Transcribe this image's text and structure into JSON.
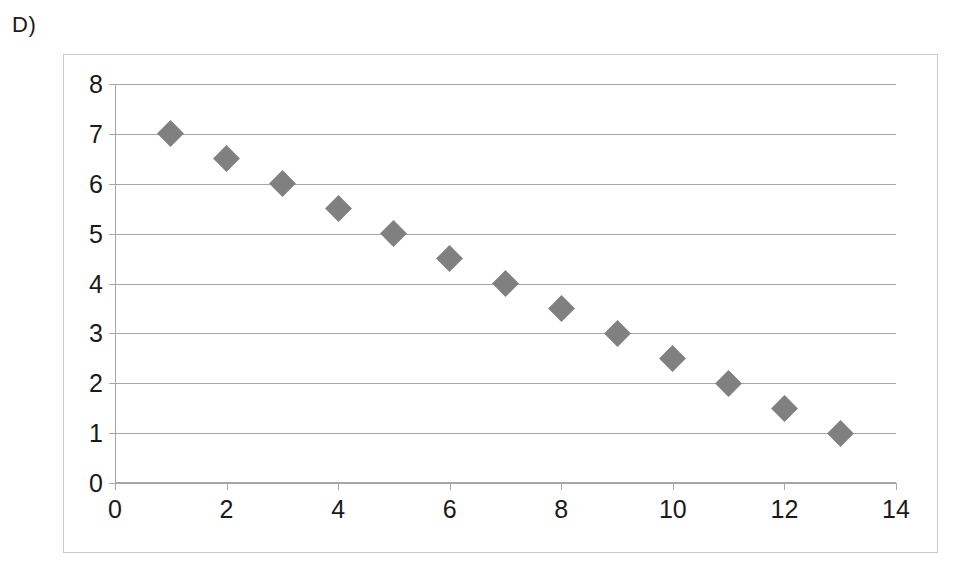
{
  "panel": {
    "label": "D)"
  },
  "colors": {
    "marker": "#808080",
    "gridline": "#a6a6a6",
    "frame_border": "#c8c8c8",
    "text": "#1a1a1a",
    "background": "#ffffff"
  },
  "chart_data": {
    "type": "scatter",
    "title": "",
    "xlabel": "",
    "ylabel": "",
    "xlim": [
      0,
      14
    ],
    "ylim": [
      0,
      8
    ],
    "x_ticks": [
      0,
      2,
      4,
      6,
      8,
      10,
      12,
      14
    ],
    "x_tick_labels": [
      "0",
      "2",
      "4",
      "6",
      "8",
      "10",
      "12",
      "14"
    ],
    "y_ticks": [
      0,
      1,
      2,
      3,
      4,
      5,
      6,
      7,
      8
    ],
    "y_tick_labels": [
      "0",
      "1",
      "2",
      "3",
      "4",
      "5",
      "6",
      "7",
      "8"
    ],
    "grid": "horizontal",
    "legend": "none",
    "marker_shape": "diamond",
    "series": [
      {
        "name": "series-1",
        "x": [
          1,
          2,
          3,
          4,
          5,
          6,
          7,
          8,
          9,
          10,
          11,
          12,
          13
        ],
        "y": [
          7,
          6.5,
          6,
          5.5,
          5,
          4.5,
          4,
          3.5,
          3,
          2.5,
          2,
          1.5,
          1
        ]
      }
    ]
  }
}
